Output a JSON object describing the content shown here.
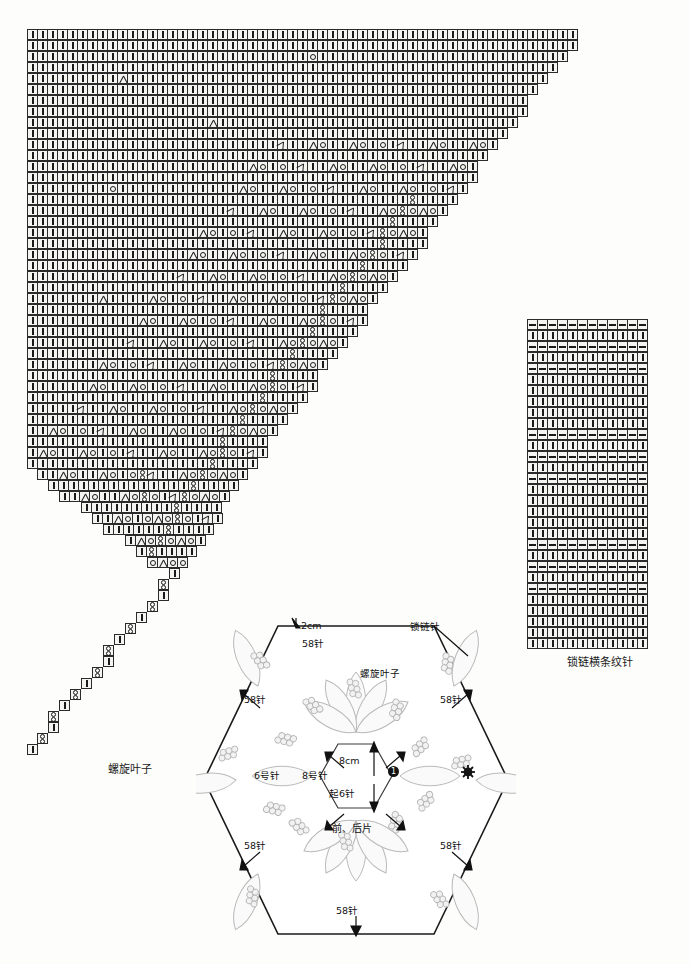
{
  "page": {
    "background": "#fdfdfb",
    "ink": "#1a1a1a"
  },
  "symbols": {
    "legend": [
      {
        "key": "bar",
        "glyph": "|",
        "name": "knit-stitch-symbol"
      },
      {
        "key": "dash",
        "glyph": "—",
        "name": "purl-stitch-symbol"
      },
      {
        "key": "o",
        "glyph": "O",
        "name": "yarn-over-symbol"
      },
      {
        "key": "dl",
        "glyph": "人",
        "name": "left-decrease-symbol"
      },
      {
        "key": "dr",
        "glyph": "ʎ",
        "name": "right-decrease-symbol"
      },
      {
        "key": "x",
        "glyph": "8",
        "name": "twisted-stitch-symbol"
      }
    ]
  },
  "charts": {
    "triangle": {
      "caption": "螺旋叶子",
      "cell_px": 11,
      "rows": 66,
      "max_cols": 55,
      "note": "right edge descends in a staircase; lower half also narrows from the left"
    },
    "stripe": {
      "caption": "锁链横条纹针",
      "cell_px": 11,
      "rows": 30,
      "cols": 12
    }
  },
  "schematic": {
    "name": "hexagon-front-back-piece",
    "center_label": "前、后片",
    "pattern_label": "螺旋叶子",
    "edge_stitch_label": "锁链针",
    "top_width": "2cm",
    "center_height": "8cm",
    "cast_on": "起6针",
    "needle_small": "6号针",
    "needle_large": "8号针",
    "step_marker": "1",
    "edges": [
      {
        "position": "top",
        "stitches": "58针"
      },
      {
        "position": "upper-left",
        "stitches": "58针"
      },
      {
        "position": "upper-right",
        "stitches": "58针"
      },
      {
        "position": "lower-left",
        "stitches": "58针"
      },
      {
        "position": "lower-right",
        "stitches": "58针"
      },
      {
        "position": "bottom",
        "stitches": "58针"
      }
    ]
  }
}
